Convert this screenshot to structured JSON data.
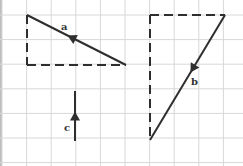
{
  "diagram": {
    "type": "vector triangles on grid",
    "grid": {
      "spacing": 24.6,
      "origin_x": 2,
      "origin_y": 15,
      "color": "#d8d8d8"
    },
    "colors": {
      "line": "#2e2e2e",
      "edge_bar": "#bdbdbd"
    },
    "vectors": [
      {
        "label": "a",
        "from": [
          126,
          65
        ],
        "to": [
          27,
          15
        ],
        "label_pos": [
          61,
          30
        ],
        "arrow_at": 0.55
      },
      {
        "label": "b",
        "from": [
          225,
          15
        ],
        "to": [
          150,
          140
        ],
        "label_pos": [
          191,
          85
        ],
        "arrow_at": 0.43
      },
      {
        "label": "c",
        "from": [
          75,
          141
        ],
        "to": [
          75,
          91
        ],
        "label_pos": [
          64,
          131
        ],
        "arrow_at": 0.5
      }
    ],
    "dashed_legs": [
      {
        "from": [
          27,
          15
        ],
        "to": [
          27,
          65
        ]
      },
      {
        "from": [
          27,
          65
        ],
        "to": [
          126,
          65
        ]
      },
      {
        "from": [
          150,
          15
        ],
        "to": [
          225,
          15
        ]
      },
      {
        "from": [
          150,
          15
        ],
        "to": [
          150,
          140
        ]
      }
    ]
  }
}
